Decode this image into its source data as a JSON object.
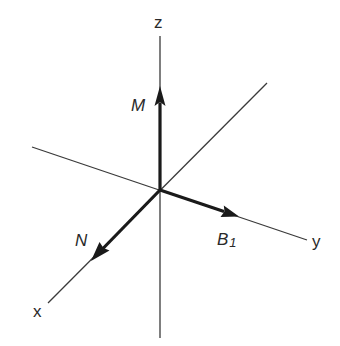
{
  "diagram": {
    "type": "3d-coordinate-axes-with-vectors",
    "origin": {
      "x": 160,
      "y": 190
    },
    "axes": [
      {
        "name": "z",
        "label": "z",
        "line": {
          "x1": 160,
          "y1": 36,
          "x2": 160,
          "y2": 338
        }
      },
      {
        "name": "y",
        "label": "y",
        "line": {
          "x1": 32,
          "y1": 147,
          "x2": 307,
          "y2": 240
        }
      },
      {
        "name": "x",
        "label": "x",
        "line": {
          "x1": 267,
          "y1": 83,
          "x2": 48,
          "y2": 303
        }
      }
    ],
    "vectors": [
      {
        "name": "M",
        "label": "M",
        "subscript": "",
        "direction": "+z",
        "tip": {
          "x": 160,
          "y": 87
        }
      },
      {
        "name": "B1",
        "label": "B",
        "subscript": "1",
        "direction": "+y",
        "tip": {
          "x": 238,
          "y": 216
        }
      },
      {
        "name": "N",
        "label": "N",
        "subscript": "",
        "direction": "+x",
        "tip": {
          "x": 92,
          "y": 260
        }
      }
    ],
    "colors": {
      "axis": "#3a3a3a",
      "vector": "#1a1a1a",
      "background": "#ffffff"
    }
  }
}
